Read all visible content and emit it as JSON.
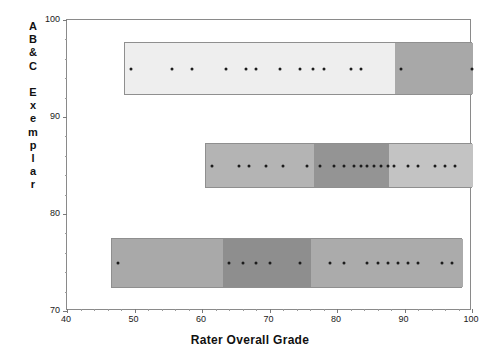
{
  "chart_data": {
    "type": "scatter",
    "title": "",
    "xlabel": "Rater Overall Grade",
    "ylabel": "A B & C Exemplar",
    "xlim": [
      40,
      100
    ],
    "ylim": [
      70,
      100
    ],
    "xticks": [
      40,
      50,
      60,
      70,
      80,
      90,
      100
    ],
    "xtick_labels": [
      "40",
      "50",
      "60",
      "70",
      "80",
      "90",
      "100"
    ],
    "yticks": [
      70,
      80,
      90,
      100
    ],
    "ytick_labels": [
      "70",
      "80",
      "90",
      "100"
    ],
    "grid": false,
    "legend": "none",
    "ylabel_letters": [
      "A",
      "B",
      "&",
      "C",
      "",
      "E",
      "x",
      "e",
      "m",
      "p",
      "l",
      "a",
      "r"
    ],
    "series": [
      {
        "name": "Exemplar A B & C",
        "y": 95,
        "values": [
          49.5,
          55.5,
          58.5,
          63.5,
          66.5,
          68.0,
          71.5,
          74.5,
          76.5,
          78.0,
          82.0,
          83.5,
          89.5,
          100.0
        ]
      },
      {
        "name": "Exemplar middle row",
        "y": 85,
        "values": [
          61.5,
          65.5,
          67.0,
          69.5,
          72.0,
          75.5,
          77.5,
          79.5,
          81.0,
          82.5,
          83.5,
          84.5,
          85.5,
          86.5,
          87.5,
          88.5,
          90.5,
          92.0,
          94.5,
          96.0,
          97.5
        ]
      },
      {
        "name": "Exemplar bottom row",
        "y": 75,
        "values": [
          47.5,
          64.0,
          66.0,
          68.0,
          70.0,
          74.5,
          79.0,
          81.0,
          84.5,
          86.0,
          87.5,
          89.0,
          90.5,
          92.0,
          95.5,
          97.0
        ]
      }
    ],
    "bands": [
      {
        "name": "band-top",
        "label": "A B & C",
        "y_center": 95,
        "x_start": 48.5,
        "x_end": 100,
        "segments": [
          {
            "from": 48.5,
            "to": 88.5,
            "color": "#eeeeee"
          },
          {
            "from": 88.5,
            "to": 100,
            "color": "#a8a8a8"
          }
        ]
      },
      {
        "name": "band-middle",
        "label": "Exemplar middle",
        "y_center": 85,
        "x_start": 60.5,
        "x_end": 100,
        "segments": [
          {
            "from": 60.5,
            "to": 76.5,
            "color": "#b4b4b4"
          },
          {
            "from": 76.5,
            "to": 87.5,
            "color": "#949494"
          },
          {
            "from": 87.5,
            "to": 100,
            "color": "#c3c3c3"
          }
        ]
      },
      {
        "name": "band-bottom",
        "label": "Exemplar bottom",
        "y_center": 75,
        "x_start": 46.5,
        "x_end": 98.5,
        "segments": [
          {
            "from": 46.5,
            "to": 63.0,
            "color": "#a9a9a9"
          },
          {
            "from": 63.0,
            "to": 76.0,
            "color": "#8e8e8e"
          },
          {
            "from": 76.0,
            "to": 98.5,
            "color": "#ababab"
          }
        ]
      }
    ],
    "colors": {
      "axis": "#8a8a8a",
      "dot": "#1c1c1c",
      "text": "#111111",
      "background": "#ffffff"
    }
  }
}
